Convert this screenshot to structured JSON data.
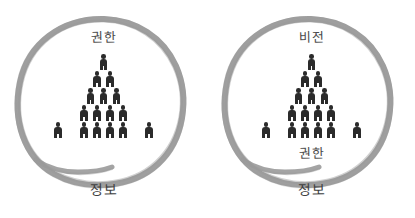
{
  "canvas": {
    "width": 415,
    "height": 218,
    "background": "#ffffff",
    "style": "hand-drawn sketch"
  },
  "colors": {
    "circle_stroke": "#9a9a9a",
    "figure": "#2b2b2b",
    "label_text": "#4a4a4a",
    "background": "#ffffff"
  },
  "diagram": {
    "type": "two-circle-comparison",
    "panels": [
      {
        "id": "left",
        "circle_label": "left-circle",
        "labels": {
          "top_inside": "권한",
          "bottom_outside": "정보"
        },
        "pyramid": {
          "rows": [
            1,
            2,
            3,
            4,
            4
          ],
          "side_outliers": 2,
          "total_figures": 16
        }
      },
      {
        "id": "right",
        "circle_label": "right-circle",
        "labels": {
          "top_inside": "비전",
          "bottom_inside": "권한",
          "bottom_outside": "정보"
        },
        "pyramid": {
          "rows": [
            1,
            2,
            3,
            4,
            4
          ],
          "side_outliers": 2,
          "total_figures": 16
        }
      }
    ]
  }
}
